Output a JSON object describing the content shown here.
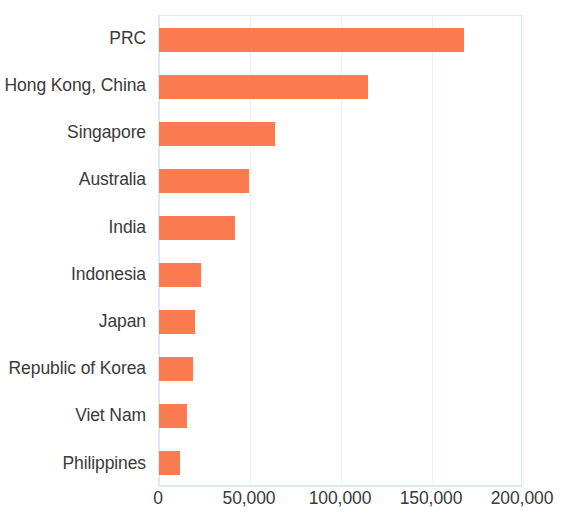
{
  "chart_data": {
    "type": "bar",
    "orientation": "horizontal",
    "title": "",
    "subtitle": "",
    "xlabel": "",
    "ylabel": "",
    "categories": [
      "PRC",
      "Hong Kong, China",
      "Singapore",
      "Australia",
      "India",
      "Indonesia",
      "Japan",
      "Republic of Korea",
      "Viet Nam",
      "Philippines"
    ],
    "values": [
      167600,
      114800,
      63700,
      49500,
      41800,
      23000,
      19800,
      18700,
      15400,
      11500
    ],
    "xlim": [
      0,
      200000
    ],
    "xticks": [
      0,
      50000,
      100000,
      150000,
      200000
    ],
    "xtick_labels": [
      "0",
      "50,000",
      "100,000",
      "150,000",
      "200,000"
    ],
    "grid": true,
    "legend": null,
    "bar_color": "#f97b4f",
    "axis_color": "#d6eaee",
    "gridline_color": "#eaf5f7",
    "text_color": "#3a3a3a"
  }
}
